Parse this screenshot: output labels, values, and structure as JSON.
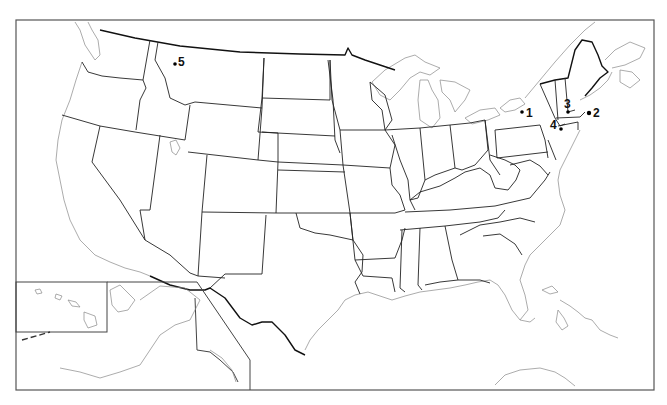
{
  "map": {
    "title": "",
    "region": "United States",
    "insets": [
      "Hawaii",
      "Alaska"
    ],
    "background_color": "#ffffff",
    "line_color": "#222222",
    "coast_color": "#888888"
  },
  "markers": [
    {
      "id": "1",
      "label": "1",
      "cx": 522,
      "cy": 112,
      "lx": 526,
      "ly": 116
    },
    {
      "id": "2",
      "label": "2",
      "cx": 589,
      "cy": 113,
      "lx": 593,
      "ly": 117
    },
    {
      "id": "3",
      "label": "3",
      "cx": 568,
      "cy": 111,
      "lx": 564,
      "ly": 106
    },
    {
      "id": "4",
      "label": "4",
      "cx": 561,
      "cy": 129,
      "lx": 550,
      "ly": 128
    },
    {
      "id": "5",
      "label": "5",
      "cx": 175,
      "cy": 63,
      "lx": 179,
      "ly": 66
    }
  ]
}
